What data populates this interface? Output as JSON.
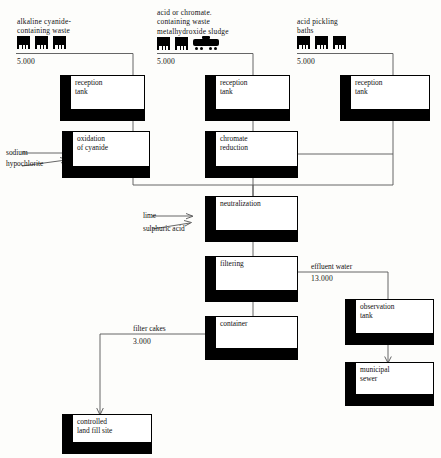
{
  "diagram": {
    "line_color": "#555555",
    "box_fill": "#ffffff",
    "box_stroke": "#000000",
    "shadow_color": "#000000"
  },
  "sources": [
    {
      "id": "source-alkaline",
      "caption": "alkaline cyanide-\ncontaining waste",
      "quantity": "5.000",
      "icons": [
        "bin-icon",
        "bin-icon",
        "bin-icon"
      ]
    },
    {
      "id": "source-acid-chromate",
      "caption": "acid or chromate.\ncontaining waste\nmetalhydroxide sludge",
      "quantity": "5.000",
      "icons": [
        "bin-icon",
        "bin-icon",
        "tanker-truck-icon"
      ]
    },
    {
      "id": "source-pickling",
      "caption": "acid pickling\nbaths",
      "quantity": "5.000",
      "icons": [
        "bin-icon",
        "bin-icon",
        "bin-icon"
      ]
    }
  ],
  "nodes": {
    "reception_tank_1": "reception\ntank",
    "reception_tank_2": "reception\ntank",
    "reception_tank_3": "reception\ntank",
    "oxidation": "oxidation\nof cyanide",
    "chromate": "chromate\nreduction",
    "neutralization": "neutralization",
    "filtering": "filtering",
    "container": "container",
    "observation_tank": "observation\ntank",
    "municipal_sewer": "municipal\nsewer",
    "landfill": "controlled\nland fill site"
  },
  "reagents": {
    "sodium_hypochlorite": "sodium\nhypochlorite",
    "lime": "lime",
    "sulphuric_acid": "sulphuric acid"
  },
  "streams": {
    "effluent_label": "effluent water",
    "effluent_value": "13.000",
    "filter_cakes_label": "filter cakes",
    "filter_cakes_value": "3.000"
  }
}
